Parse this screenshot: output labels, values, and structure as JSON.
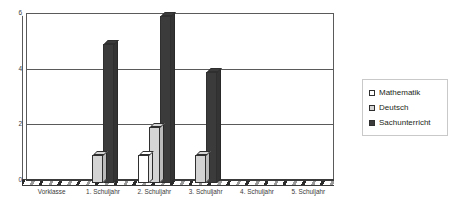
{
  "chart_data": {
    "type": "bar",
    "title": "",
    "subtitle": "",
    "xlabel": "",
    "ylabel": "",
    "ylim": [
      0,
      6
    ],
    "yticks": [
      "0",
      "2",
      "4",
      "6"
    ],
    "grid": true,
    "legend_position": "right",
    "style": "3d-column",
    "categories": [
      "Vorklasse",
      "1. Schuljahr",
      "2. Schuljahr",
      "3. Schuljahr",
      "4. Schuljahr",
      "5. Schuljahr"
    ],
    "series": [
      {
        "name": "Mathematik",
        "color": "#ffffff",
        "values": [
          0,
          0,
          1,
          0,
          0,
          0
        ]
      },
      {
        "name": "Deutsch",
        "color": "#d4d4d4",
        "values": [
          0,
          1,
          2,
          1,
          0,
          0
        ]
      },
      {
        "name": "Sachunterricht",
        "color": "#3b3b3b",
        "values": [
          0,
          5,
          6,
          4,
          0,
          0
        ]
      }
    ]
  },
  "legend": {
    "items": [
      {
        "label": "Mathematik",
        "color": "#ffffff"
      },
      {
        "label": "Deutsch",
        "color": "#d4d4d4"
      },
      {
        "label": "Sachunterricht",
        "color": "#3b3b3b"
      }
    ]
  },
  "axes": {
    "y_tick_labels": [
      "6",
      "4",
      "2",
      "0"
    ],
    "x_tick_labels": [
      "Vorklasse",
      "1. Schuljahr",
      "2. Schuljahr",
      "3. Schuljahr",
      "4. Schuljahr",
      "5. Schuljahr"
    ]
  }
}
